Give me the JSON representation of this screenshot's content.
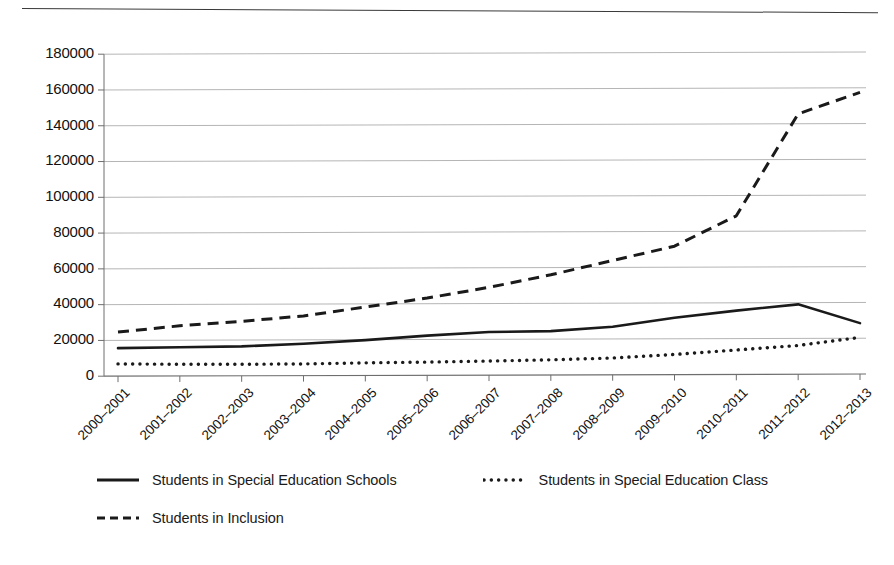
{
  "chart_data": {
    "type": "line",
    "title": "",
    "subtitle": "",
    "xlabel": "",
    "ylabel": "",
    "categories": [
      "2000–2001",
      "2001–2002",
      "2002–2003",
      "2003–2004",
      "2004–2005",
      "2005–2006",
      "2006–2007",
      "2007–2008",
      "2008–2009",
      "2009–2010",
      "2010–2011",
      "2011–2012",
      "2012–2013"
    ],
    "series": [
      {
        "name": "Students in Special Education Schools",
        "style": "solid",
        "color": "#1a1a1a",
        "values": [
          15000,
          15500,
          16000,
          17500,
          19500,
          22000,
          24000,
          24500,
          27000,
          32000,
          36000,
          39500,
          29000
        ]
      },
      {
        "name": "Students in Special Education Class",
        "style": "dotted",
        "color": "#1a1a1a",
        "values": [
          6200,
          6000,
          6000,
          6200,
          6800,
          7200,
          7800,
          8500,
          9500,
          11500,
          14000,
          16500,
          21000
        ]
      },
      {
        "name": "Students in Inclusion",
        "style": "dashed",
        "color": "#1a1a1a",
        "values": [
          24000,
          27500,
          30000,
          33000,
          38000,
          43000,
          49000,
          56000,
          64000,
          72000,
          89000,
          146000,
          158000
        ]
      }
    ],
    "ylim": [
      0,
      180000
    ],
    "ytick_values": [
      0,
      20000,
      40000,
      60000,
      80000,
      100000,
      120000,
      140000,
      160000,
      180000
    ],
    "ytick_labels": [
      "0",
      "20000",
      "40000",
      "60000",
      "80000",
      "100000",
      "120000",
      "140000",
      "160000",
      "180000"
    ],
    "grid": "horizontal",
    "legend_position": "bottom",
    "legend_entries": [
      "Students in Special Education Schools",
      "Students in Special Education Class",
      "Students in Inclusion"
    ]
  },
  "colors": {
    "ink": "#1a1a1a",
    "gridline": "#a8a8a8",
    "axis": "#6e6e6e",
    "background": "#ffffff"
  }
}
